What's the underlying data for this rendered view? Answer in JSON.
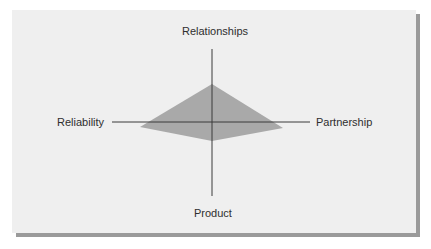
{
  "diagram": {
    "type": "four-axis radar / diamond profile",
    "axes": {
      "top": "Relationships",
      "left": "Reliability",
      "right": "Partnership",
      "bottom": "Product"
    },
    "colors": {
      "panel_background": "#efefef",
      "panel_shadow": "#9a9a9a",
      "shape_fill": "#a9a9a9",
      "axis_line": "#3a3a3a",
      "label_text": "#2e2e2e"
    }
  }
}
